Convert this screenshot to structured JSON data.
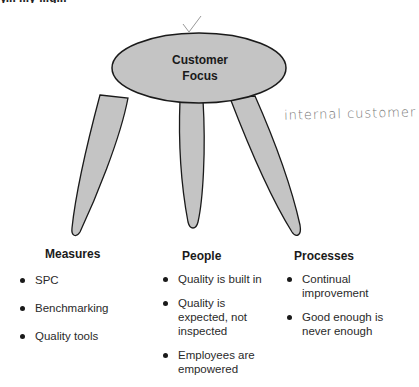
{
  "header": {
    "partial_text": "y... ...y ...g..."
  },
  "diagram": {
    "seat": {
      "label_line1": "Customer",
      "label_line2": "Focus",
      "fill": "#c4c4c4",
      "stroke": "#1a1a1a"
    },
    "annotation": {
      "handwritten": "internal customer",
      "checkmark": "✓"
    }
  },
  "legs": [
    {
      "title": "Measures",
      "items": [
        "SPC",
        "Benchmarking",
        "Quality tools"
      ]
    },
    {
      "title": "People",
      "items": [
        "Quality is built in",
        "Quality is expected, not inspected",
        "Employees are empowered"
      ]
    },
    {
      "title": "Processes",
      "items": [
        "Continual improvement",
        "Good enough is never enough"
      ]
    }
  ]
}
